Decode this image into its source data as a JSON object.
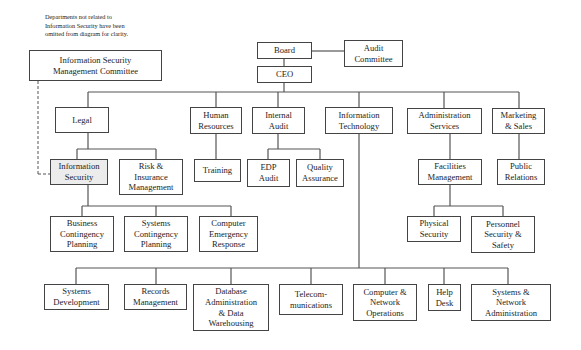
{
  "note": {
    "lines": [
      "Departments not related to",
      "Information Security have been",
      "omitted from diagram for clarity."
    ]
  },
  "colors": {
    "line": "#555555",
    "border": "#444444",
    "highlight_fill": "#ececec"
  },
  "nodes": {
    "board": {
      "lines": [
        "Board"
      ]
    },
    "audit_committee": {
      "lines": [
        "Audit",
        "Committee"
      ]
    },
    "ceo": {
      "lines": [
        "CEO"
      ]
    },
    "ismc": {
      "lines": [
        "Information Security",
        "Management Committee"
      ]
    },
    "legal": {
      "lines": [
        "Legal"
      ]
    },
    "human_resources": {
      "lines": [
        "Human",
        "Resources"
      ]
    },
    "internal_audit": {
      "lines": [
        "Internal",
        "Audit"
      ]
    },
    "information_technology": {
      "lines": [
        "Information",
        "Technology"
      ]
    },
    "administration_services": {
      "lines": [
        "Administration",
        "Services"
      ]
    },
    "marketing_sales": {
      "lines": [
        "Marketing",
        "& Sales"
      ]
    },
    "information_security": {
      "lines": [
        "Information",
        "Security"
      ]
    },
    "risk_insurance": {
      "lines": [
        "Risk &",
        "Insurance",
        "Management"
      ]
    },
    "training": {
      "lines": [
        "Training"
      ]
    },
    "edp_audit": {
      "lines": [
        "EDP",
        "Audit"
      ]
    },
    "quality_assurance": {
      "lines": [
        "Quality",
        "Assurance"
      ]
    },
    "facilities_management": {
      "lines": [
        "Facilities",
        "Management"
      ]
    },
    "public_relations": {
      "lines": [
        "Public",
        "Relations"
      ]
    },
    "business_contingency": {
      "lines": [
        "Business",
        "Contingency",
        "Planning"
      ]
    },
    "systems_contingency": {
      "lines": [
        "Systems",
        "Contingency",
        "Planning"
      ]
    },
    "computer_emergency": {
      "lines": [
        "Computer",
        "Emergency",
        "Response"
      ]
    },
    "physical_security": {
      "lines": [
        "Physical",
        "Security"
      ]
    },
    "personnel_security": {
      "lines": [
        "Personnel",
        "Security &",
        "Safety"
      ]
    },
    "systems_development": {
      "lines": [
        "Systems",
        "Development"
      ]
    },
    "records_management": {
      "lines": [
        "Records",
        "Management"
      ]
    },
    "database_admin": {
      "lines": [
        "Database",
        "Administration",
        "& Data",
        "Warehousing"
      ]
    },
    "telecommunications": {
      "lines": [
        "Telecom-",
        "munications"
      ]
    },
    "computer_network_ops": {
      "lines": [
        "Computer &",
        "Network",
        "Operations"
      ]
    },
    "help_desk": {
      "lines": [
        "Help",
        "Desk"
      ]
    },
    "systems_network_admin": {
      "lines": [
        "Systems &",
        "Network",
        "Administration"
      ]
    }
  }
}
